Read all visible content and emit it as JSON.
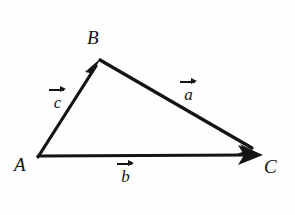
{
  "figure": {
    "background_color": "#fefefe",
    "ink_color": "#141414",
    "vertices": [
      {
        "id": "A",
        "label": "A",
        "x": 38,
        "y": 157
      },
      {
        "id": "B",
        "label": "B",
        "x": 100,
        "y": 60
      },
      {
        "id": "C",
        "label": "C",
        "x": 262,
        "y": 155
      }
    ],
    "vectors": [
      {
        "id": "c",
        "label": "c",
        "from": "A",
        "to": "B",
        "notation": "arrow-over"
      },
      {
        "id": "a",
        "label": "a",
        "from": "B",
        "to": "C",
        "notation": "arrow-over"
      },
      {
        "id": "b",
        "label": "b",
        "from": "A",
        "to": "C",
        "notation": "arrow-over"
      }
    ],
    "vertex_labels": {
      "A": "A",
      "B": "B",
      "C": "C"
    },
    "vector_labels": {
      "a": "a",
      "b": "b",
      "c": "c"
    }
  }
}
